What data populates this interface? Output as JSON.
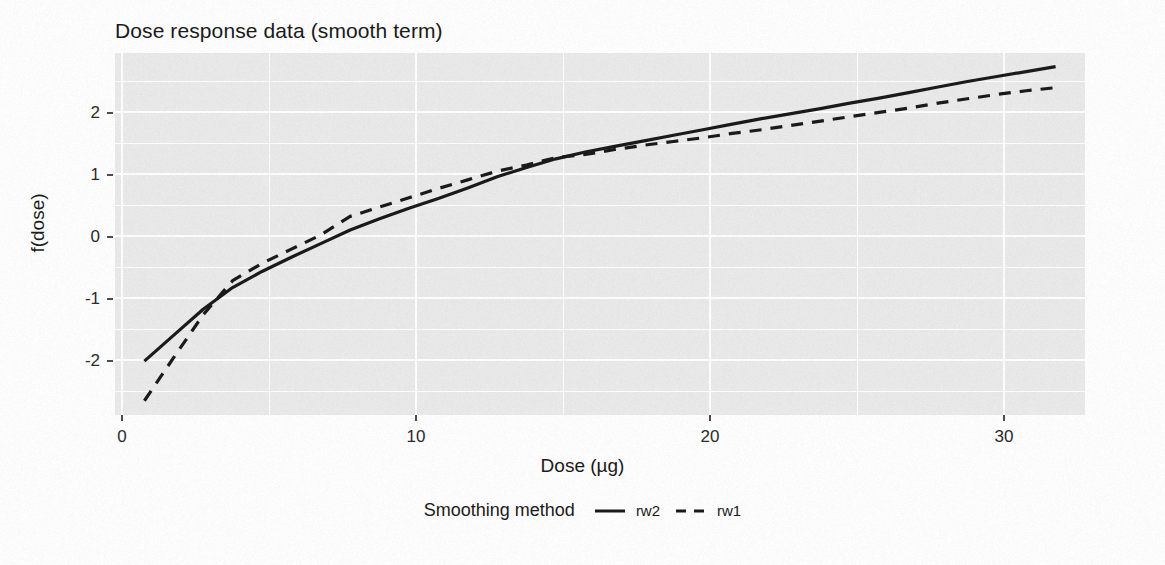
{
  "chart_data": {
    "type": "line",
    "title": "Dose response data (smooth term)",
    "xlabel": "Dose (µg)",
    "ylabel": "f(dose)",
    "xlim": [
      0,
      33
    ],
    "ylim": [
      -2.95,
      2.9
    ],
    "xticks": [
      0,
      10,
      20,
      30
    ],
    "xtick_labels": [
      "0",
      "10",
      "20",
      "30"
    ],
    "yticks": [
      -2,
      -1,
      0,
      1,
      2
    ],
    "ytick_labels": [
      "-2",
      "-1",
      "0",
      "1",
      "2"
    ],
    "grid": "major and minor white gridlines on grey panel",
    "legend_position": "bottom",
    "legend_title": "Smoothing method",
    "panel_background": "#ebebeb",
    "gridline_color": "#ffffff",
    "line_color": "#1a1a1a",
    "series": [
      {
        "name": "rw2",
        "linetype": "solid",
        "x": [
          1.0,
          2.0,
          3.0,
          4.0,
          5.0,
          6.0,
          7.0,
          8.0,
          9.0,
          10.0,
          11.0,
          12.0,
          13.0,
          14.0,
          15.0,
          16.0,
          17.0,
          18.0,
          19.0,
          20.0,
          21.0,
          22.0,
          23.0,
          24.0,
          25.0,
          26.0,
          27.0,
          28.0,
          29.0,
          30.0,
          31.0,
          32.0
        ],
        "y": [
          -2.08,
          -1.66,
          -1.24,
          -0.89,
          -0.63,
          -0.4,
          -0.18,
          0.04,
          0.22,
          0.39,
          0.55,
          0.72,
          0.9,
          1.05,
          1.19,
          1.3,
          1.39,
          1.48,
          1.57,
          1.66,
          1.75,
          1.84,
          1.92,
          2.0,
          2.09,
          2.17,
          2.26,
          2.35,
          2.44,
          2.52,
          2.6,
          2.68
        ]
      },
      {
        "name": "rw1",
        "linetype": "dashed",
        "x": [
          1.0,
          2.0,
          3.0,
          4.0,
          5.0,
          6.0,
          7.0,
          8.0,
          9.0,
          10.0,
          11.0,
          12.0,
          13.0,
          14.0,
          15.0,
          16.0,
          17.0,
          18.0,
          19.0,
          20.0,
          21.0,
          22.0,
          23.0,
          24.0,
          25.0,
          26.0,
          27.0,
          28.0,
          29.0,
          30.0,
          31.0,
          32.0
        ],
        "y": [
          -2.72,
          -2.02,
          -1.33,
          -0.78,
          -0.5,
          -0.27,
          -0.04,
          0.26,
          0.41,
          0.56,
          0.71,
          0.85,
          0.99,
          1.09,
          1.21,
          1.26,
          1.34,
          1.41,
          1.47,
          1.53,
          1.6,
          1.66,
          1.73,
          1.8,
          1.87,
          1.94,
          2.01,
          2.09,
          2.16,
          2.23,
          2.29,
          2.34
        ]
      }
    ]
  },
  "title": "Dose response data (smooth term)",
  "axes": {
    "x_title": "Dose (µg)",
    "y_title": "f(dose)",
    "x_tick_labels": [
      "0",
      "10",
      "20",
      "30"
    ],
    "y_tick_labels": [
      "2",
      "1",
      "0",
      "-1",
      "-2"
    ]
  },
  "legend": {
    "title": "Smoothing method",
    "items": [
      {
        "label": "rw2",
        "style": "solid"
      },
      {
        "label": "rw1",
        "style": "dashed"
      }
    ]
  }
}
